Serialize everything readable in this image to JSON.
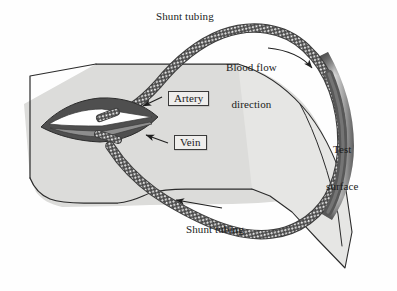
{
  "figure": {
    "type": "anatomical-schematic",
    "background_color": "#fefefe"
  },
  "labels": {
    "shunt_tubing_top": "Shunt tubing",
    "shunt_tubing_bottom": "Shunt tubing",
    "blood_flow_line1": "Blood flow",
    "blood_flow_line2": "direction",
    "artery": "Artery",
    "vein": "Vein",
    "test_surface_line1": "Test",
    "test_surface_line2": "surface"
  },
  "colors": {
    "tissue_fill": "#dcdcda",
    "tissue_flap_fill": "#e4e4e2",
    "outline": "#2b2b2b",
    "tubing_dark": "#4a4a4a",
    "tubing_light": "#f2f2f2",
    "vessel_dark": "#5a5a5a",
    "artery_fill": "#ffffff",
    "vein_fill": "#8e8e8e",
    "junction_dark": "#4f4f4f",
    "test_surface_dark": "#5c5c5c",
    "test_surface_light": "#e8e8e8",
    "label_text": "#1b1b1b",
    "label_box_fill": "#efeeec",
    "label_box_border": "#3a3a3a"
  },
  "elements": {
    "tissue_flap": "Light gray skin/tissue flap occupying the left and lower-middle of the figure",
    "av_junction": "Dark lens-shaped arteriovenous junction containing the white artery band and gray vein band",
    "tubing_loop": "Braided shunt tubing forming a large loop from the artery, over the test surface, and back to the vein",
    "test_surface": "Curved vertical gradient band along the right side over which the tubing passes",
    "flow_arrow_top": "Curved arrow indicating blood flow direction downward along the right tubing",
    "flow_arrow_bottom": "Straight arrow pointing left indicating return flow in the lower tubing",
    "artery_leader": "Leader arrow from the Artery box to the white artery band",
    "vein_leader": "Leader arrow from the Vein box to the gray vein band"
  }
}
